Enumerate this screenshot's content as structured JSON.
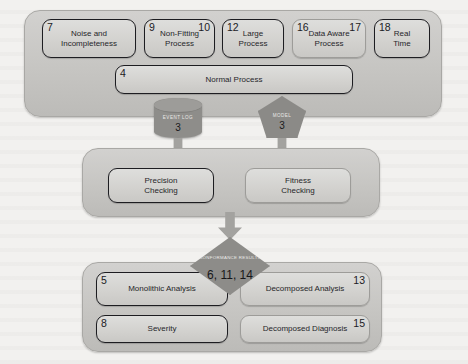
{
  "diagram": {
    "colors": {
      "panel": "#c6c5c2",
      "box_fill": "#d5d4d1",
      "dark_outline": "#1d1d21",
      "shape_grey": "#8d8c89",
      "arrow_grey": "#a3a29f",
      "background": "#f2f1ef"
    },
    "top_panel": {
      "name": "input-characteristics-panel",
      "boxes": [
        {
          "id": "noise-and-incompleteness",
          "label": "Noise and\nIncompleteness",
          "tl": "7",
          "tr": "",
          "outline": "dark"
        },
        {
          "id": "non-fitting-process",
          "label": "Non-Fitting\nProcess",
          "tl": "9",
          "tr": "10",
          "outline": "dark"
        },
        {
          "id": "large-process",
          "label": "Large\nProcess",
          "tl": "12",
          "tr": "",
          "outline": "dark"
        },
        {
          "id": "data-aware-process",
          "label": "Data Aware\nProcess",
          "tl": "16",
          "tr": "17",
          "outline": "light"
        },
        {
          "id": "real-time",
          "label": "Real\nTime",
          "tl": "18",
          "tr": "",
          "outline": "dark"
        }
      ],
      "normal_process": {
        "id": "normal-process",
        "label": "Normal Process",
        "tl": "4",
        "tr": "",
        "outline": "dark"
      }
    },
    "artifacts": {
      "event_log": {
        "id": "event-log",
        "caption": "EVENT LOG",
        "number": "3"
      },
      "model": {
        "id": "model",
        "caption": "MODEL",
        "number": "3"
      }
    },
    "checking_panel": {
      "name": "conformance-checking-panel",
      "boxes": [
        {
          "id": "precision-checking",
          "label": "Precision\nChecking",
          "tl": "",
          "tr": "",
          "outline": "dark"
        },
        {
          "id": "fitness-checking",
          "label": "Fitness\nChecking",
          "tl": "",
          "tr": "",
          "outline": "light"
        }
      ]
    },
    "conformance_results": {
      "id": "conformance-results",
      "caption": "CONFORMANCE\nRESULTS",
      "number": "6, 11, 14"
    },
    "analysis_panel": {
      "name": "analysis-panel",
      "boxes": [
        {
          "id": "monolithic-analysis",
          "label": "Monolithic  Analysis",
          "tl": "5",
          "tr": "",
          "outline": "dark"
        },
        {
          "id": "decomposed-analysis",
          "label": "Decomposed Analysis",
          "tl": "",
          "tr": "13",
          "outline": "light"
        },
        {
          "id": "severity",
          "label": "Severity",
          "tl": "8",
          "tr": "",
          "outline": "dark"
        },
        {
          "id": "decomposed-diagnosis",
          "label": "Decomposed Diagnosis",
          "tl": "",
          "tr": "15",
          "outline": "light"
        }
      ]
    },
    "arrows": [
      {
        "id": "arrow-event-log-to-precision"
      },
      {
        "id": "arrow-model-to-fitness"
      },
      {
        "id": "arrow-checking-to-results"
      }
    ]
  }
}
